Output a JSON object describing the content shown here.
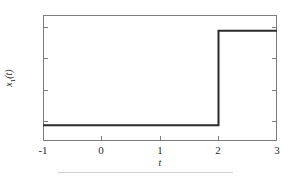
{
  "figure": {
    "background_color": "#ffffff",
    "axis_color": "#7c7c7c",
    "line_color": "#2b2b2b"
  },
  "axes": {
    "xlabel": "t",
    "ylabel_variable": "x",
    "ylabel_subscript": "1",
    "ylabel_argument": "(t)",
    "xticklabels": [
      "-1",
      "0",
      "1",
      "2",
      "3"
    ],
    "yticklabels": [
      "2",
      "1",
      "0",
      "-1"
    ]
  },
  "footer": {
    "rule_color": "#cfcfcf"
  },
  "chart_data": {
    "type": "line",
    "title": "",
    "subtitle": "",
    "xlabel": "t",
    "ylabel": "x1(t)",
    "xlim": [
      -1,
      3
    ],
    "ylim": [
      -1.5,
      2.5
    ],
    "xticks": [
      -1,
      0,
      1,
      2,
      3
    ],
    "yticks": [
      2,
      1,
      0,
      -1
    ],
    "grid": false,
    "legend": null,
    "series": [
      {
        "name": "x1(t)",
        "description": "Piecewise-constant step signal: value -1 for -1 <= t < 2, value 2 for 2 <= t <= 3",
        "x": [
          -1,
          2,
          2,
          3
        ],
        "y": [
          -1,
          -1,
          2,
          2
        ]
      }
    ],
    "annotations": []
  }
}
